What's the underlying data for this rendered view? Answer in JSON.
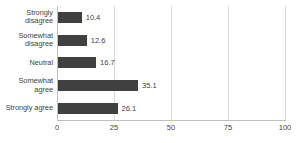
{
  "chart_data": {
    "type": "bar",
    "orientation": "horizontal",
    "title": "",
    "xlabel": "",
    "ylabel": "",
    "xlim": [
      0,
      100
    ],
    "xticks": [
      0,
      25,
      50,
      75,
      100
    ],
    "xtick_labels": [
      "0",
      "25",
      "50",
      "75",
      "100"
    ],
    "grid": "vertical",
    "legend": "none",
    "bar_color": "#404040",
    "gridline_color": "#d9d9d9",
    "axis_color": "#bfbfbf",
    "text_color": "#3f3f3f",
    "categories": [
      "Strongly disagree",
      "Somewhat disagree",
      "Neutral",
      "Somewhat agree",
      "Strongly agree"
    ],
    "values": [
      10.4,
      12.6,
      16.7,
      35.1,
      26.1
    ],
    "data_labels": [
      "10.4",
      "12.6",
      "16.7",
      "35.1",
      "26.1"
    ]
  }
}
